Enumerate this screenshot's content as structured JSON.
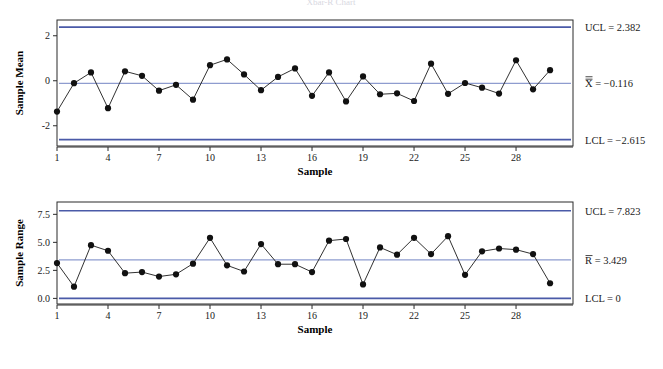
{
  "title": "Xbar-R Chart",
  "charts": [
    {
      "id": "xbar",
      "ylabel": "Sample Mean",
      "xlabel": "Sample",
      "yticks": [
        "2",
        "0",
        "-2"
      ],
      "ytick_values": [
        2,
        0,
        -2
      ],
      "xticks": [
        "1",
        "4",
        "7",
        "10",
        "13",
        "16",
        "19",
        "22",
        "25",
        "28"
      ],
      "xtick_values": [
        1,
        4,
        7,
        10,
        13,
        16,
        19,
        22,
        25,
        28
      ],
      "ucl_label": "UCL = 2.382",
      "center_label": "X̅̅ = −0.116",
      "lcl_label": "LCL = −2.615",
      "ucl": 2.382,
      "center": -0.116,
      "lcl": -2.615
    },
    {
      "id": "range",
      "ylabel": "Sample Range",
      "xlabel": "Sample",
      "yticks": [
        "7.5",
        "5.0",
        "2.5",
        "0.0"
      ],
      "ytick_values": [
        7.5,
        5.0,
        2.5,
        0.0
      ],
      "xticks": [
        "1",
        "4",
        "7",
        "10",
        "13",
        "16",
        "19",
        "22",
        "25",
        "28"
      ],
      "xtick_values": [
        1,
        4,
        7,
        10,
        13,
        16,
        19,
        22,
        25,
        28
      ],
      "ucl_label": "UCL = 7.823",
      "center_label": "R̅ = 3.429",
      "lcl_label": "LCL = 0",
      "ucl": 7.823,
      "center": 3.429,
      "lcl": 0
    }
  ],
  "colors": {
    "limit_line": "#4a5aa8",
    "center_line": "#8e9ccf",
    "series_line": "#1a1a1a",
    "marker": "#111111",
    "frame": "#2b2b2b",
    "background": "#ffffff"
  },
  "chart_data": [
    {
      "type": "line",
      "title": "Xbar Chart",
      "xlabel": "Sample",
      "ylabel": "Sample Mean",
      "x": [
        1,
        2,
        3,
        4,
        5,
        6,
        7,
        8,
        9,
        10,
        11,
        12,
        13,
        14,
        15,
        16,
        17,
        18,
        19,
        20,
        21,
        22,
        23,
        24,
        25,
        26,
        27,
        28,
        29,
        30
      ],
      "values": [
        -1.37,
        -0.11,
        0.37,
        -1.22,
        0.42,
        0.22,
        -0.44,
        -0.18,
        -0.84,
        0.69,
        0.95,
        0.28,
        -0.42,
        0.17,
        0.55,
        -0.67,
        0.37,
        -0.92,
        0.19,
        -0.6,
        -0.56,
        -0.9,
        0.76,
        -0.58,
        -0.1,
        -0.31,
        -0.57,
        0.91,
        -0.38,
        0.47
      ],
      "ylim": [
        -2.9,
        2.7
      ],
      "yticks": [
        2,
        0,
        -2
      ],
      "xticks": [
        1,
        4,
        7,
        10,
        13,
        16,
        19,
        22,
        25,
        28
      ],
      "grid": false,
      "legend": "none",
      "control_limits": {
        "ucl": 2.382,
        "center": -0.116,
        "lcl": -2.615,
        "ucl_label": "UCL = 2.382",
        "center_label": "X̅̅ = −0.116",
        "lcl_label": "LCL = −2.615"
      }
    },
    {
      "type": "line",
      "title": "R Chart",
      "xlabel": "Sample",
      "ylabel": "Sample Range",
      "x": [
        1,
        2,
        3,
        4,
        5,
        6,
        7,
        8,
        9,
        10,
        11,
        12,
        13,
        14,
        15,
        16,
        17,
        18,
        19,
        20,
        21,
        22,
        23,
        24,
        25,
        26,
        27,
        28,
        29,
        30
      ],
      "values": [
        3.15,
        1.05,
        4.75,
        4.25,
        2.25,
        2.35,
        1.95,
        2.15,
        3.1,
        5.4,
        2.95,
        2.4,
        4.85,
        3.05,
        3.05,
        2.35,
        5.15,
        5.3,
        1.25,
        4.55,
        3.9,
        5.4,
        3.95,
        5.55,
        2.1,
        4.2,
        4.45,
        4.35,
        3.95,
        1.35
      ],
      "ylim": [
        -0.5,
        8.6
      ],
      "yticks": [
        7.5,
        5.0,
        2.5,
        0.0
      ],
      "xticks": [
        1,
        4,
        7,
        10,
        13,
        16,
        19,
        22,
        25,
        28
      ],
      "grid": false,
      "legend": "none",
      "control_limits": {
        "ucl": 7.823,
        "center": 3.429,
        "lcl": 0,
        "ucl_label": "UCL = 7.823",
        "center_label": "R̅ = 3.429",
        "lcl_label": "LCL = 0"
      }
    }
  ]
}
